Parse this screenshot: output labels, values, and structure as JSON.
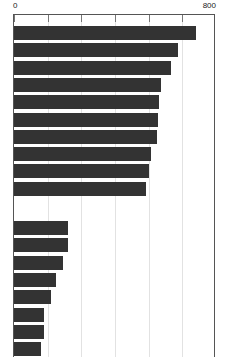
{
  "chart_data": {
    "type": "bar",
    "orientation": "horizontal",
    "title": "",
    "subtitle": "",
    "xlabel": "",
    "ylabel": "",
    "xlim": [
      0,
      800
    ],
    "ylim": null,
    "grid": true,
    "legend": null,
    "legend_position": "none",
    "bar_color": "#333333",
    "background_color": "#ffffff",
    "gridline_color": "#e2e2e2",
    "axis_color": "#555555",
    "axis_tick_labels": [
      "0",
      "800"
    ],
    "axis_tick_values": [
      0,
      800
    ],
    "gridline_values": [
      0,
      133,
      267,
      400,
      533,
      667,
      800
    ],
    "categories": [
      "",
      "",
      "",
      "",
      "",
      "",
      "",
      "",
      "",
      "",
      "",
      "",
      "",
      "",
      "",
      "",
      "",
      ""
    ],
    "values": [
      720,
      650,
      620,
      582,
      575,
      570,
      565,
      542,
      535,
      522,
      215,
      213,
      195,
      166,
      147,
      120,
      118,
      106
    ],
    "groups": [
      {
        "name": "upper-group",
        "start_index": 0,
        "count": 10
      },
      {
        "name": "lower-group",
        "start_index": 10,
        "count": 8
      }
    ]
  },
  "axis": {
    "min_label": "0",
    "max_label": "800"
  }
}
